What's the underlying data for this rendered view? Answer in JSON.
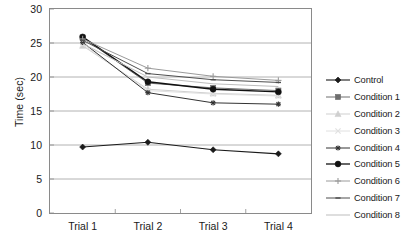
{
  "chart_data": {
    "type": "line",
    "title": "",
    "xlabel": "",
    "ylabel": "Time (sec)",
    "categories": [
      "Trial 1",
      "Trial 2",
      "Trial 3",
      "Trial 4"
    ],
    "ylim": [
      0,
      30
    ],
    "yticks": [
      0,
      5,
      10,
      15,
      20,
      25,
      30
    ],
    "ytick_labels": [
      "0",
      "5",
      "10",
      "15",
      "20",
      "25",
      "30"
    ],
    "grid": "horizontal",
    "legend_position": "right",
    "series": [
      {
        "name": "Control",
        "values": [
          9.7,
          10.4,
          9.3,
          8.7
        ],
        "color": "#1a1a1a",
        "marker": "diamond",
        "line_width": 1.1
      },
      {
        "name": "Condition 1",
        "values": [
          25.8,
          19.1,
          18.4,
          18.0
        ],
        "color": "#6e6e6e",
        "marker": "square",
        "line_width": 1.0
      },
      {
        "name": "Condition 2",
        "values": [
          24.6,
          18.2,
          17.6,
          17.3
        ],
        "color": "#cfcfcf",
        "marker": "triangle",
        "line_width": 1.0
      },
      {
        "name": "Condition 3",
        "values": [
          24.8,
          18.0,
          17.5,
          17.2
        ],
        "color": "#e0e0e0",
        "marker": "cross",
        "line_width": 1.0
      },
      {
        "name": "Condition 4",
        "values": [
          25.1,
          17.7,
          16.2,
          16.0
        ],
        "color": "#333333",
        "marker": "star",
        "line_width": 1.0
      },
      {
        "name": "Condition 5",
        "values": [
          25.9,
          19.3,
          18.2,
          17.8
        ],
        "color": "#111111",
        "marker": "circle",
        "line_width": 1.3
      },
      {
        "name": "Condition 6",
        "values": [
          25.6,
          21.3,
          20.1,
          19.5
        ],
        "color": "#9a9a9a",
        "marker": "plus",
        "line_width": 1.0
      },
      {
        "name": "Condition 7",
        "values": [
          25.4,
          20.5,
          19.6,
          19.2
        ],
        "color": "#4d4d4d",
        "marker": "dash",
        "line_width": 1.0
      },
      {
        "name": "Condition 8",
        "values": [
          24.9,
          20.0,
          19.0,
          18.6
        ],
        "color": "#bdbdbd",
        "marker": "none",
        "line_width": 1.0
      }
    ]
  },
  "axes": {
    "y_title": "Time (sec)"
  }
}
